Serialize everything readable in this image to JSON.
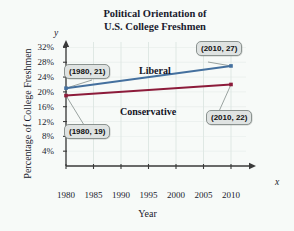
{
  "chart_data": {
    "type": "line",
    "title": "Political Orientation of U.S. College Freshmen",
    "title_line1": "Political Orientation of",
    "title_line2": "U.S. College Freshmen",
    "xlabel": "Year",
    "ylabel": "Percentage of College Freshmen",
    "x_axis_letter": "y",
    "y_axis_letter": "x",
    "xlim": [
      1980,
      2012
    ],
    "ylim": [
      0,
      34
    ],
    "xticks": [
      1980,
      1985,
      1990,
      1995,
      2000,
      2005,
      2010
    ],
    "xticklabels": [
      "1980",
      "1985",
      "1990",
      "1995",
      "2000",
      "2005",
      "2010"
    ],
    "yticks": [
      4,
      8,
      12,
      16,
      20,
      24,
      28,
      32
    ],
    "yticklabels": [
      "4%",
      "8%",
      "12%",
      "16%",
      "20%",
      "24%",
      "28%",
      "32%"
    ],
    "grid": "vertical-light",
    "legend": "inline-labels",
    "x": [
      1980,
      2010
    ],
    "series": [
      {
        "name": "Liberal",
        "color": "#44709e",
        "values": [
          21,
          27
        ],
        "points": [
          {
            "x": 1980,
            "y": 21,
            "label": "(1980, 21)"
          },
          {
            "x": 2010,
            "y": 27,
            "label": "(2010, 27)"
          }
        ]
      },
      {
        "name": "Conservative",
        "color": "#8c1b3a",
        "values": [
          19,
          22
        ],
        "points": [
          {
            "x": 1980,
            "y": 19,
            "label": "(1980, 19)"
          },
          {
            "x": 2010,
            "y": 22,
            "label": "(2010, 22)"
          }
        ]
      }
    ],
    "annotations": [
      {
        "id": "liberal-start",
        "text": "(1980, 21)"
      },
      {
        "id": "liberal-end",
        "text": "(2010, 27)"
      },
      {
        "id": "conservative-start",
        "text": "(1980, 19)"
      },
      {
        "id": "conservative-end",
        "text": "(2010, 22)"
      }
    ]
  },
  "colors": {
    "background": "#f7faf8",
    "axis": "#3a3a3a",
    "grid": "#dfe8e4",
    "liberal": "#44709e",
    "conservative": "#8c1b3a",
    "callout_fill": "#dfe3e2",
    "callout_border": "#8b9390",
    "text": "#1a1a2e"
  }
}
